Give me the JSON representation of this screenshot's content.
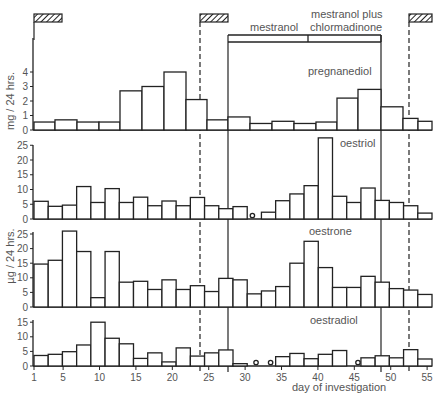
{
  "chart_data": {
    "type": "bar",
    "title": "",
    "xlabel": "day of investigation",
    "x_ticks": [
      1,
      5,
      10,
      15,
      20,
      25,
      30,
      35,
      40,
      45,
      50,
      55
    ],
    "x_range": [
      1,
      55
    ],
    "bin_width_days": 2,
    "bin_starts": [
      1,
      3,
      5,
      7,
      9,
      11,
      13,
      15,
      17,
      19,
      21,
      23,
      25,
      27,
      29,
      31,
      33,
      35,
      37,
      39,
      41,
      43,
      45,
      47,
      49,
      51,
      53
    ],
    "treatment_periods": [
      {
        "label": "mestranol",
        "start_day": 28,
        "end_day": 38.5
      },
      {
        "label": "mestranol plus chlormadinone",
        "start_day": 38.5,
        "end_day": 49
      }
    ],
    "menstruation_markers": [
      {
        "start_day": 1,
        "end_day": 7
      },
      {
        "start_day": 24,
        "end_day": 30
      },
      {
        "start_day": 53,
        "end_day": 55
      }
    ],
    "dashed_lines_day": [
      24,
      53
    ],
    "solid_lines_day": [
      28,
      49
    ],
    "panels": [
      {
        "name": "pregnanediol",
        "ylabel": "mg / 24 hrs.",
        "ylim": [
          0,
          4.5
        ],
        "y_ticks": [
          0,
          1,
          2,
          3,
          4
        ],
        "values": [
          0.55,
          0.7,
          0.55,
          0.55,
          0.55,
          2.7,
          3.0,
          4.0,
          2.1,
          0.7,
          0.9,
          0.45,
          0.6,
          0.45,
          0.55,
          2.2,
          2.8,
          1.6,
          0.8,
          0.6
        ],
        "bins_days": [
          1,
          5,
          9,
          13,
          17,
          13,
          15,
          17,
          19,
          21,
          23,
          25,
          27,
          29,
          31,
          33,
          35,
          37,
          39,
          41,
          43,
          45,
          47,
          49,
          51,
          53
        ]
      },
      {
        "name": "oestriol",
        "ylabel": "µg / 24 hrs.",
        "ylim": [
          0,
          25
        ],
        "y_ticks": [
          0,
          5,
          10,
          15,
          20,
          25
        ],
        "values": [
          6.0,
          4.3,
          4.7,
          11.0,
          5.6,
          10.3,
          5.6,
          7.4,
          4.5,
          6.1,
          4.5,
          7.3,
          4.5,
          3.5,
          4.2,
          null,
          2.3,
          6.2,
          8.5,
          11.3,
          27.5,
          7.7,
          5.6,
          10.5,
          6.3,
          5.6,
          4.5,
          2.0
        ],
        "open_circle_days": [
          31
        ]
      },
      {
        "name": "oestrone",
        "ylabel": "µg / 24 hrs.",
        "ylim": [
          0,
          27
        ],
        "y_ticks": [
          0,
          5,
          10,
          15,
          20,
          25
        ],
        "values": [
          14.7,
          16.0,
          26.0,
          19.0,
          3.2,
          19.0,
          8.5,
          8.8,
          6.0,
          9.3,
          6.0,
          7.3,
          5.3,
          9.8,
          9.3,
          4.5,
          5.5,
          7.0,
          15.0,
          22.5,
          13.5,
          6.7,
          6.7,
          10.5,
          8.5,
          6.3,
          5.8,
          4.3
        ]
      },
      {
        "name": "oestradiol",
        "ylabel": "",
        "ylim": [
          0,
          16
        ],
        "y_ticks": [
          0,
          5,
          10,
          15
        ],
        "values": [
          3.6,
          4.0,
          4.9,
          7.2,
          15.0,
          9.5,
          7.6,
          2.6,
          4.5,
          1.4,
          6.2,
          3.4,
          4.5,
          5.5,
          0.8,
          null,
          null,
          3.2,
          4.3,
          2.5,
          4.0,
          5.3,
          null,
          2.8,
          3.5,
          2.8,
          5.6,
          2.4
        ],
        "open_circle_days": [
          31.5,
          33.5,
          45.5
        ]
      }
    ],
    "annotations": [
      "mestranol",
      "mestranol plus chlormadinone",
      "pregnanediol",
      "oestriol",
      "oestrone",
      "oestradiol"
    ],
    "grid": false,
    "legend": "none (panel labels inline)"
  },
  "labels": {
    "treatment_1": "mestranol",
    "treatment_2_line1": "mestranol plus",
    "treatment_2_line2": "chlormadinone",
    "panel_pregnanediol": "pregnanediol",
    "panel_oestriol": "oestriol",
    "panel_oestrone": "oestrone",
    "panel_oestradiol": "oestradiol",
    "ylabel_mg": "mg / 24 hrs.",
    "ylabel_ug": "µg / 24 hrs.",
    "xlabel": "day of investigation"
  }
}
